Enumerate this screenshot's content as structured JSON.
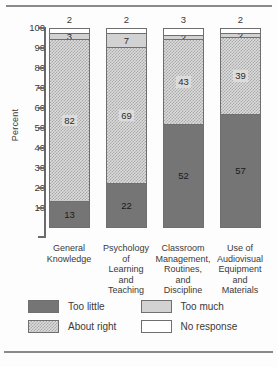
{
  "chart_data": {
    "type": "bar",
    "subtype": "stacked-vertical",
    "title": "",
    "xlabel": "",
    "ylabel": "Percent",
    "ylim": [
      0,
      100
    ],
    "yticks": [
      10,
      20,
      30,
      40,
      50,
      60,
      70,
      80,
      90,
      100
    ],
    "grid": false,
    "legend_position": "bottom",
    "categories": [
      "General Knowledge",
      "Psychology of Learning and Teaching",
      "Classroom Management, Routines, and Discipline",
      "Use of Audiovisual Equipment and Materials"
    ],
    "category_lines": [
      [
        "General",
        "Knowledge"
      ],
      [
        "Psychology",
        "of",
        "Learning",
        "and",
        "Teaching"
      ],
      [
        "Classroom",
        "Management,",
        "Routines,",
        "and",
        "Discipline"
      ],
      [
        "Use of",
        "Audiovisual",
        "Equipment",
        "and",
        "Materials"
      ]
    ],
    "series": [
      {
        "name": "Too little",
        "key": "too_little",
        "color": "#757575",
        "values": [
          13,
          22,
          52,
          57
        ]
      },
      {
        "name": "About right",
        "key": "about_right",
        "color": "#dcdcdc",
        "values": [
          82,
          69,
          43,
          39
        ]
      },
      {
        "name": "Too much",
        "key": "too_much",
        "color": "#d2d2d2",
        "values": [
          3,
          7,
          2,
          2
        ]
      },
      {
        "name": "No response",
        "key": "no_response",
        "color": "#ffffff",
        "values": [
          2,
          2,
          3,
          2
        ]
      }
    ],
    "top_labels": [
      "2",
      "2",
      "3",
      "2"
    ],
    "bar_value_labels": [
      {
        "too_little": "13",
        "about_right": "82",
        "too_much": "3",
        "no_response": ""
      },
      {
        "too_little": "22",
        "about_right": "69",
        "too_much": "7",
        "no_response": ""
      },
      {
        "too_little": "52",
        "about_right": "43",
        "too_much": "2",
        "no_response": ""
      },
      {
        "too_little": "57",
        "about_right": "39",
        "too_much": "2",
        "no_response": ""
      }
    ],
    "legend": [
      {
        "label": "Too little",
        "swatch": "sw-toolittle"
      },
      {
        "label": "Too much",
        "swatch": "sw-toomuch"
      },
      {
        "label": "About right",
        "swatch": "sw-aboutright"
      },
      {
        "label": "No response",
        "swatch": "sw-noresponse"
      }
    ],
    "axis": {
      "tick_labels": [
        "100",
        "90",
        "80",
        "70",
        "60",
        "50",
        "40",
        "30",
        "20",
        "10"
      ]
    }
  }
}
